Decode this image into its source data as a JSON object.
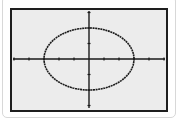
{
  "colors": {
    "card_background": "#ffffff",
    "card_border": "#d8d8d8",
    "screen_frame": "#1e1e1e",
    "screen_background": "#ececec",
    "axis": "#1a1a1a",
    "curve": "#1a1a1a"
  },
  "chart_data": {
    "type": "line",
    "title": "",
    "xlabel": "",
    "ylabel": "",
    "equation": "x^2/9 + y^2/4 = 1",
    "center": [
      0,
      0
    ],
    "semi_axis_x": 3,
    "semi_axis_y": 2,
    "xlim": [
      -5,
      5
    ],
    "ylim": [
      -3,
      3
    ],
    "x_ticks": [
      -5,
      -4,
      -3,
      -2,
      -1,
      1,
      2,
      3,
      4,
      5
    ],
    "y_ticks": [
      -3,
      -2,
      -1,
      1,
      2,
      3
    ],
    "grid": false,
    "legend": null,
    "series": [
      {
        "name": "ellipse",
        "style": "dotted-pixel",
        "key_points": [
          {
            "x": 3,
            "y": 0
          },
          {
            "x": 0,
            "y": 2
          },
          {
            "x": -3,
            "y": 0
          },
          {
            "x": 0,
            "y": -2
          }
        ]
      }
    ]
  },
  "layout": {
    "origin_px": [
      89,
      59
    ],
    "x_unit_px": 15,
    "y_unit_px": 15.5
  }
}
